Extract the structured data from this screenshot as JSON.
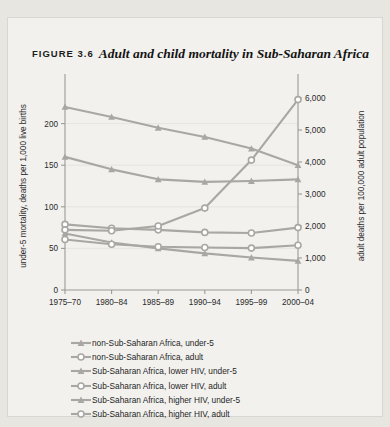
{
  "figure": {
    "label": "FIGURE 3.6",
    "caption": "Adult and child mortality in Sub-Saharan Africa"
  },
  "chart_data": {
    "type": "line",
    "title": "Adult and child mortality in Sub-Saharan Africa",
    "xlabel": "period",
    "ylabel": "under-5 mortality, deaths per 1,000 live births",
    "y2label": "adult deaths per 100,000 adult population",
    "categories": [
      "1975–70",
      "1980–84",
      "1985–89",
      "1990–94",
      "1995–99",
      "2000–04"
    ],
    "ylim": [
      0,
      250
    ],
    "yticks": [
      0,
      50,
      100,
      150,
      200
    ],
    "yticklabels": [
      "0",
      "50",
      "100",
      "150",
      "200"
    ],
    "y2lim": [
      0,
      6500
    ],
    "y2ticks": [
      0,
      1000,
      2000,
      3000,
      4000,
      5000,
      6000
    ],
    "y2ticklabels": [
      "0",
      "1,000",
      "2,000",
      "3,000",
      "4,000",
      "5,000",
      "6,000"
    ],
    "grid": false,
    "legend_position": "below",
    "series": [
      {
        "name": "non-Sub-Saharan Africa, under-5",
        "axis": "left",
        "marker": "triangle",
        "color": "#a9a7a3",
        "values": [
          68,
          57,
          50,
          44,
          39,
          35
        ]
      },
      {
        "name": "non-Sub-Saharan Africa, adult",
        "axis": "right",
        "marker": "circle",
        "color": "#a9a7a3",
        "values": [
          1580,
          1430,
          1350,
          1330,
          1310,
          1400
        ]
      },
      {
        "name": "Sub-Saharan Africa, lower HIV, under-5",
        "axis": "left",
        "marker": "triangle",
        "color": "#a9a7a3",
        "values": [
          220,
          208,
          195,
          184,
          170,
          150
        ]
      },
      {
        "name": "Sub-Saharan Africa, lower HIV, adult",
        "axis": "right",
        "marker": "circle",
        "color": "#a9a7a3",
        "values": [
          2050,
          1930,
          1880,
          1800,
          1780,
          1950
        ]
      },
      {
        "name": "Sub-Saharan Africa, higher HIV, under-5",
        "axis": "left",
        "marker": "triangle",
        "color": "#a9a7a3",
        "values": [
          160,
          145,
          133,
          130,
          131,
          133
        ]
      },
      {
        "name": "Sub-Saharan Africa, higher HIV, adult",
        "axis": "right",
        "marker": "circle",
        "color": "#a9a7a3",
        "values": [
          1880,
          1850,
          2000,
          2560,
          4060,
          5950
        ]
      }
    ]
  },
  "legend": {
    "items": [
      {
        "label": "non-Sub-Saharan Africa, under-5",
        "marker": "triangle"
      },
      {
        "label": "non-Sub-Saharan Africa, adult",
        "marker": "circle"
      },
      {
        "label": "Sub-Saharan Africa, lower HIV, under-5",
        "marker": "triangle"
      },
      {
        "label": "Sub-Saharan Africa, lower HIV, adult",
        "marker": "circle"
      },
      {
        "label": "Sub-Saharan Africa, higher HIV, under-5",
        "marker": "triangle"
      },
      {
        "label": "Sub-Saharan Africa, higher HIV, adult",
        "marker": "circle"
      }
    ]
  }
}
